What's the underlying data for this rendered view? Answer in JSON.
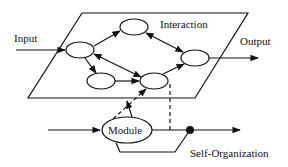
{
  "diagram": {
    "labels": {
      "input": "Input",
      "output": "Output",
      "interaction": "Interaction",
      "module": "Module",
      "self_organization": "Self-Organization"
    },
    "colors": {
      "stroke": "#111111",
      "background": "#ffffff"
    },
    "nodes": [
      {
        "id": "A",
        "position": "left"
      },
      {
        "id": "B",
        "position": "top"
      },
      {
        "id": "C",
        "position": "right"
      },
      {
        "id": "D",
        "position": "bottom-left"
      },
      {
        "id": "E",
        "position": "bottom-middle"
      }
    ],
    "edges": [
      {
        "from": "Input",
        "to": "A",
        "style": "solid",
        "direction": "forward"
      },
      {
        "from": "A",
        "to": "B",
        "style": "solid",
        "direction": "forward"
      },
      {
        "from": "B",
        "to": "C",
        "style": "solid",
        "direction": "bidirectional"
      },
      {
        "from": "A",
        "to": "E",
        "style": "solid",
        "direction": "bidirectional"
      },
      {
        "from": "A",
        "to": "D",
        "style": "solid",
        "direction": "forward"
      },
      {
        "from": "D",
        "to": "E",
        "style": "solid",
        "direction": "forward"
      },
      {
        "from": "E",
        "to": "C",
        "style": "solid",
        "direction": "forward"
      },
      {
        "from": "C",
        "to": "Output",
        "style": "solid",
        "direction": "forward"
      },
      {
        "from": "Module",
        "to": "E",
        "style": "dashed",
        "direction": "forward"
      },
      {
        "from": "Module",
        "to": "plane",
        "style": "solid",
        "direction": "forward"
      },
      {
        "from": "E",
        "to": "Self-Organization",
        "style": "dashed",
        "direction": "none"
      },
      {
        "from": "Module-input",
        "to": "Module",
        "style": "solid",
        "direction": "forward"
      },
      {
        "from": "Module",
        "to": "Self-Organization",
        "style": "solid",
        "direction": "forward"
      }
    ]
  }
}
